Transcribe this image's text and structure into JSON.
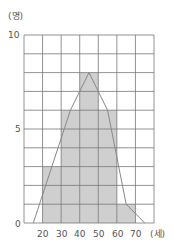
{
  "chart_data": {
    "type": "bar",
    "subtype": "histogram_with_frequency_polygon",
    "title": "",
    "xlabel": "(세)",
    "ylabel": "(명)",
    "x_ticks": [
      20,
      30,
      40,
      50,
      60,
      70
    ],
    "y_ticks": [
      0,
      5,
      10
    ],
    "xlim": [
      10,
      80
    ],
    "ylim": [
      0,
      10
    ],
    "grid": true,
    "bins": [
      [
        20,
        30
      ],
      [
        30,
        40
      ],
      [
        40,
        50
      ],
      [
        50,
        60
      ],
      [
        60,
        70
      ]
    ],
    "categories": [
      "20-30",
      "30-40",
      "40-50",
      "50-60",
      "60-70"
    ],
    "values": [
      3,
      6,
      8,
      6,
      1
    ],
    "polygon": {
      "x": [
        15,
        25,
        35,
        45,
        55,
        65,
        75
      ],
      "y": [
        0,
        3,
        6,
        8,
        6,
        1,
        0
      ]
    },
    "colors": {
      "bar": "#cfcfcf",
      "grid": "#777777",
      "line": "#888888"
    }
  },
  "labels": {
    "y_unit": "(명)",
    "x_unit": "(세)",
    "y0": "0",
    "y5": "5",
    "y10": "10",
    "x20": "20",
    "x30": "30",
    "x40": "40",
    "x50": "50",
    "x60": "60",
    "x70": "70"
  }
}
